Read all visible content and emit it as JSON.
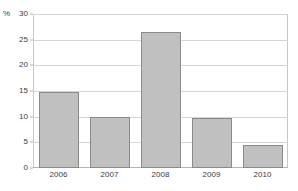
{
  "chart_data": {
    "type": "bar",
    "title": "",
    "subtitle": "",
    "xlabel": "",
    "ylabel": "%",
    "unit_label": "%",
    "categories": [
      "2006",
      "2007",
      "2008",
      "2009",
      "2010"
    ],
    "values": [
      14.8,
      10.0,
      26.4,
      9.7,
      4.5
    ],
    "series": [
      {
        "name": "",
        "values": [
          14.8,
          10.0,
          26.4,
          9.7,
          4.5
        ]
      }
    ],
    "ylim": [
      0,
      30
    ],
    "yticks": [
      0,
      5,
      10,
      15,
      20,
      25,
      30
    ],
    "ytick_labels": [
      "0",
      "5",
      "10",
      "15",
      "20",
      "25",
      "30"
    ],
    "grid": true,
    "grid_axis": "y",
    "legend": false,
    "legend_position": "none",
    "annotations": [],
    "colors": {
      "bar_fill": "#c0c0c0",
      "bar_border": "#8a8a8a",
      "gridline": "#d5d5d5",
      "frame": "#c8c8c8",
      "axis": "#b4b4b4",
      "text": "#3b3b3b",
      "background": "#ffffff"
    }
  }
}
